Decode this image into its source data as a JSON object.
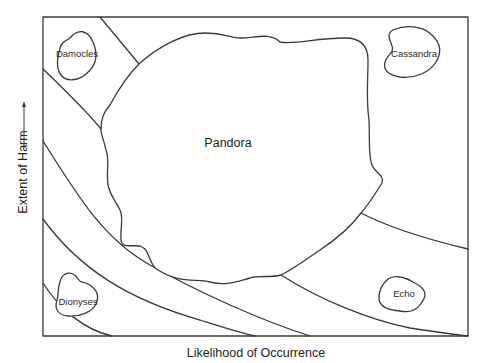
{
  "diagram": {
    "x_axis_label": "Likelihood of Occurrence",
    "y_axis_label": "Extent of Harm",
    "y_axis_arrow": "up-arrow",
    "regions": [
      {
        "name": "Damocles",
        "position": "top-left"
      },
      {
        "name": "Cassandra",
        "position": "top-right"
      },
      {
        "name": "Pandora",
        "position": "center"
      },
      {
        "name": "Dionyses",
        "position": "bottom-left"
      },
      {
        "name": "Echo",
        "position": "bottom-right"
      }
    ],
    "boundary_curves": 6,
    "line_color": "#3a3a36"
  }
}
